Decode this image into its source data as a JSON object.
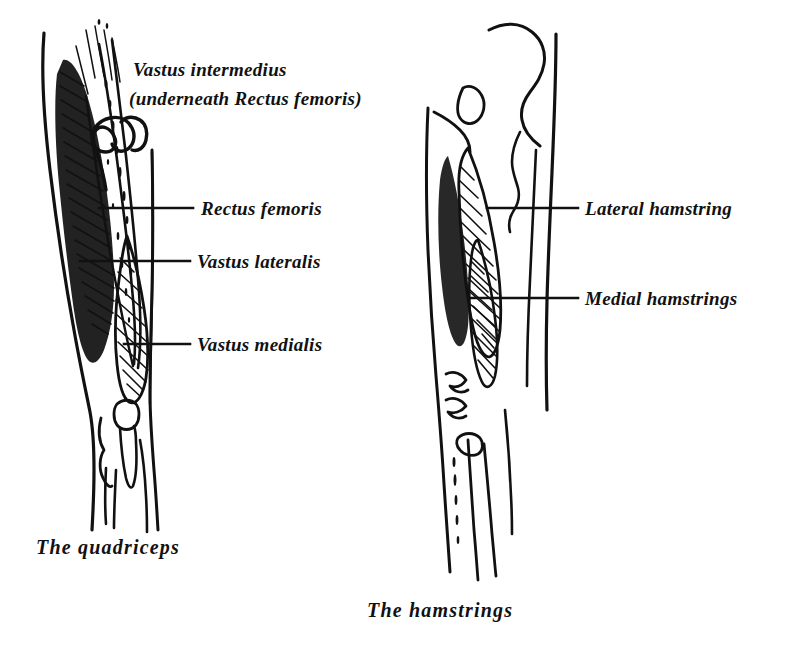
{
  "document": {
    "kind": "anatomical-line-drawing",
    "background_color": "#ffffff",
    "ink_color": "#111111",
    "title": ""
  },
  "figures": [
    {
      "id": "quadriceps",
      "caption": "The  quadriceps",
      "view": "anterior thigh, right leg",
      "labels": [
        {
          "id": "vastus-intermedius",
          "line1": "Vastus intermedius",
          "line2": "(underneath Rectus femoris)",
          "pointer": "squiggle",
          "text_x": 133,
          "text_y": 76
        },
        {
          "id": "rectus-femoris",
          "text": "Rectus femoris",
          "pointer": "leader-line",
          "text_x": 201,
          "text_y": 215,
          "leader_from_x": 99,
          "leader_to_x": 193,
          "leader_y": 208
        },
        {
          "id": "vastus-lateralis",
          "text": "Vastus lateralis",
          "pointer": "leader-line",
          "text_x": 197,
          "text_y": 268,
          "leader_from_x": 80,
          "leader_to_x": 190,
          "leader_y": 261
        },
        {
          "id": "vastus-medialis",
          "text": "Vastus medialis",
          "pointer": "leader-line",
          "text_x": 197,
          "text_y": 351,
          "leader_from_x": 124,
          "leader_to_x": 190,
          "leader_y": 344
        }
      ]
    },
    {
      "id": "hamstrings",
      "caption": "The  hamstrings",
      "view": "posterior thigh, right leg",
      "labels": [
        {
          "id": "lateral-hamstring",
          "text": "Lateral hamstring",
          "pointer": "leader-line",
          "text_x": 585,
          "text_y": 215,
          "leader_from_x": 487,
          "leader_to_x": 578,
          "leader_y": 208
        },
        {
          "id": "medial-hamstrings",
          "text": "Medial hamstrings",
          "pointer": "leader-line",
          "text_x": 585,
          "text_y": 305,
          "leader_from_x": 471,
          "leader_to_x": 578,
          "leader_y": 298
        }
      ]
    }
  ],
  "captions": {
    "left": "The  quadriceps",
    "right": "The  hamstrings",
    "left_x": 36,
    "left_y": 554,
    "right_x": 367,
    "right_y": 617
  }
}
